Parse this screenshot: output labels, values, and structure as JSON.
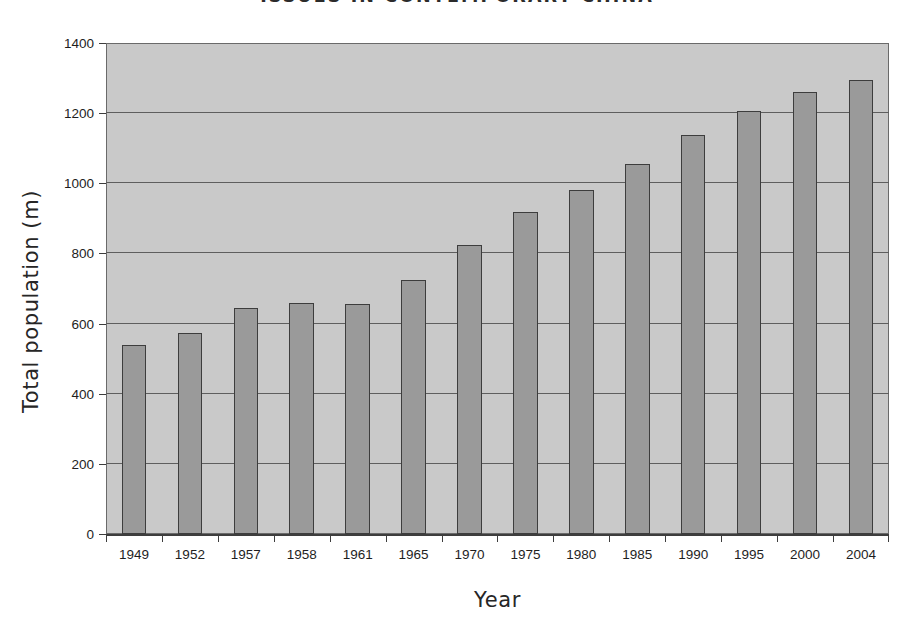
{
  "page_header": {
    "running_head": "ISSUES IN CONTEMPORARY CHINA"
  },
  "chart_data": {
    "type": "bar",
    "title": "",
    "xlabel": "Year",
    "ylabel": "Total population (m)",
    "categories": [
      "1949",
      "1952",
      "1957",
      "1958",
      "1961",
      "1965",
      "1970",
      "1975",
      "1980",
      "1985",
      "1990",
      "1995",
      "2000",
      "2004"
    ],
    "values": [
      540,
      572,
      645,
      658,
      655,
      723,
      825,
      918,
      981,
      1055,
      1139,
      1205,
      1260,
      1295
    ],
    "ylim": [
      0,
      1400
    ],
    "ytick_step": 200,
    "yticks": [
      "1400",
      "1200",
      "1000",
      "800",
      "600",
      "400",
      "200",
      "0"
    ],
    "ytick_values": [
      1400,
      1200,
      1000,
      800,
      600,
      400,
      200,
      0
    ],
    "grid": true,
    "grid_axis": "y",
    "legend": false,
    "legend_position": "none",
    "colors": {
      "bar_fill": "#9a9a9a",
      "bar_border": "#3d3d3d",
      "plot_background": "#c9c9c9",
      "gridline": "#5e5e5e",
      "axis": "#3d3d3d",
      "text": "#1e1e1e",
      "page_background": "#ffffff"
    }
  }
}
